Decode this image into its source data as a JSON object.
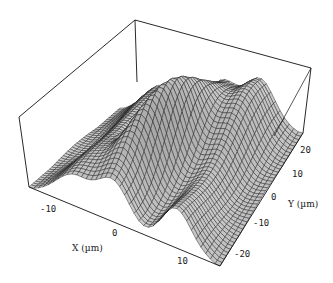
{
  "chart_data": {
    "type": "surface3d",
    "title": "",
    "xlabel": "X (µm)",
    "ylabel": "Y (µm)",
    "zlabel": "",
    "xlim": [
      -15,
      15
    ],
    "ylim": [
      -25,
      25
    ],
    "x_ticks": [
      "-10",
      "0",
      "10"
    ],
    "y_ticks": [
      "-20",
      "-10",
      "0",
      "10",
      "20"
    ],
    "surface_features": [
      {
        "name": "central-ridge",
        "x_center": 0,
        "y_range": [
          -25,
          25
        ],
        "height": 1.0
      },
      {
        "name": "side-hump-positive-x",
        "x_center": 8,
        "height": 0.55
      },
      {
        "name": "side-hump-negative-x",
        "x_center": -8,
        "height": 0.45
      }
    ],
    "grid": false,
    "box": true,
    "mesh_color": "#1a1a1a",
    "surface_fill": "#e8e8e8"
  },
  "axes": {
    "x_title": "X (µm)",
    "y_title": "Y (µm)",
    "x_tick_labels": [
      "-10",
      "0",
      "10"
    ],
    "y_tick_labels": [
      "20",
      "10",
      "0",
      "-10",
      "-20"
    ]
  }
}
